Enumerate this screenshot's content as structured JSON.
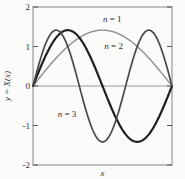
{
  "figure": {
    "background_color": "#fbfbf9",
    "frame_color": "#9a9a9a",
    "tick_color": "#555555",
    "text_color": "#2e2e2e"
  },
  "chart_data": {
    "type": "line",
    "title": "",
    "xlabel": "x",
    "ylabel": "y = X(x)",
    "xlim": [
      0,
      1
    ],
    "ylim": [
      -2,
      2
    ],
    "yticks": [
      {
        "value": 2,
        "label": "2"
      },
      {
        "value": 1,
        "label": "1"
      },
      {
        "value": 0,
        "label": "0"
      },
      {
        "value": -1,
        "label": "-1"
      },
      {
        "value": -2,
        "label": "-2"
      }
    ],
    "xticks": [],
    "grid": false,
    "zero_line": true,
    "legend_position": "inline-annotations",
    "amplitude": 1.414,
    "curve_function": "y = 1.414 * sin(n * pi * x)",
    "series": [
      {
        "name": "n = 1",
        "n": 1,
        "color": "#8e8e8e",
        "stroke_width": 1.4,
        "x": [
          0,
          0.1,
          0.2,
          0.3,
          0.4,
          0.5,
          0.6,
          0.7,
          0.8,
          0.9,
          1
        ],
        "values": [
          0,
          0.437,
          0.831,
          1.144,
          1.345,
          1.414,
          1.345,
          1.144,
          0.831,
          0.437,
          0
        ]
      },
      {
        "name": "n = 2",
        "n": 2,
        "color": "#1f1f1f",
        "stroke_width": 2.2,
        "x": [
          0,
          0.1,
          0.2,
          0.3,
          0.4,
          0.5,
          0.6,
          0.7,
          0.8,
          0.9,
          1
        ],
        "values": [
          0,
          0.831,
          1.345,
          1.345,
          0.831,
          0,
          -0.831,
          -1.345,
          -1.345,
          -0.831,
          0
        ]
      },
      {
        "name": "n = 3",
        "n": 3,
        "color": "#4a4a4a",
        "stroke_width": 1.7,
        "x": [
          0,
          0.1,
          0.2,
          0.3,
          0.4,
          0.5,
          0.6,
          0.7,
          0.8,
          0.9,
          1
        ],
        "values": [
          0,
          1.144,
          1.345,
          0.437,
          -0.831,
          -1.414,
          -0.831,
          0.437,
          1.345,
          1.144,
          0
        ]
      }
    ],
    "annotations": [
      {
        "text": "n = 1",
        "x": 0.57,
        "y": 1.7,
        "series": "n = 1"
      },
      {
        "text": "n = 2",
        "x": 0.58,
        "y": 1.01,
        "series": "n = 2"
      },
      {
        "text": "n = 3",
        "x": 0.245,
        "y": -0.71,
        "series": "n = 3"
      }
    ]
  }
}
